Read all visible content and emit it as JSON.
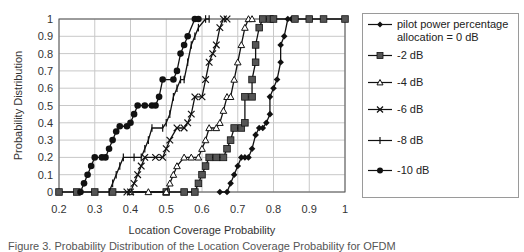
{
  "chart_data": {
    "type": "line",
    "title": "",
    "xlabel": "Location Coverage Probability",
    "ylabel": "Probability Distribution",
    "xlim": [
      0.2,
      1.0
    ],
    "ylim": [
      0,
      1
    ],
    "x_ticks": [
      "0.2",
      "0.3",
      "0.4",
      "0.5",
      "0.6",
      "0.7",
      "0.8",
      "0.9",
      "1"
    ],
    "y_ticks": [
      "0",
      "0.1",
      "0.2",
      "0.3",
      "0.4",
      "0.5",
      "0.6",
      "0.7",
      "0.8",
      "0.9",
      "1"
    ],
    "grid": true,
    "legend_position": "right",
    "series": [
      {
        "name": "pilot power percentage allocation = 0 dB",
        "marker": "diamond",
        "points": [
          [
            0.65,
            0
          ],
          [
            0.67,
            0.0
          ],
          [
            0.68,
            0.05
          ],
          [
            0.69,
            0.1
          ],
          [
            0.7,
            0.15
          ],
          [
            0.71,
            0.2
          ],
          [
            0.72,
            0.2
          ],
          [
            0.73,
            0.2
          ],
          [
            0.74,
            0.25
          ],
          [
            0.75,
            0.33
          ],
          [
            0.76,
            0.37
          ],
          [
            0.77,
            0.37
          ],
          [
            0.78,
            0.4
          ],
          [
            0.79,
            0.45
          ],
          [
            0.79,
            0.55
          ],
          [
            0.8,
            0.6
          ],
          [
            0.81,
            0.65
          ],
          [
            0.82,
            0.75
          ],
          [
            0.82,
            0.85
          ],
          [
            0.83,
            0.9
          ],
          [
            0.84,
            1.0
          ],
          [
            0.85,
            1.0
          ]
        ]
      },
      {
        "name": "-2 dB",
        "marker": "square",
        "points": [
          [
            0.2,
            0
          ],
          [
            0.25,
            0
          ],
          [
            0.3,
            0
          ],
          [
            0.35,
            0
          ],
          [
            0.5,
            0
          ],
          [
            0.55,
            0
          ],
          [
            0.58,
            0
          ],
          [
            0.59,
            0.05
          ],
          [
            0.6,
            0.1
          ],
          [
            0.61,
            0.15
          ],
          [
            0.62,
            0.2
          ],
          [
            0.64,
            0.2
          ],
          [
            0.66,
            0.2
          ],
          [
            0.67,
            0.25
          ],
          [
            0.68,
            0.3
          ],
          [
            0.69,
            0.37
          ],
          [
            0.71,
            0.37
          ],
          [
            0.72,
            0.4
          ],
          [
            0.72,
            0.55
          ],
          [
            0.74,
            0.55
          ],
          [
            0.74,
            0.65
          ],
          [
            0.75,
            0.75
          ],
          [
            0.75,
            0.85
          ],
          [
            0.76,
            0.95
          ],
          [
            0.77,
            1.0
          ],
          [
            0.79,
            1.0
          ],
          [
            0.8,
            1.0
          ],
          [
            0.86,
            1.0
          ],
          [
            0.9,
            1.0
          ],
          [
            0.94,
            1.0
          ],
          [
            1.0,
            1.0
          ]
        ]
      },
      {
        "name": "-4 dB",
        "marker": "triangle",
        "points": [
          [
            0.4,
            0
          ],
          [
            0.45,
            0
          ],
          [
            0.5,
            0
          ],
          [
            0.51,
            0.05
          ],
          [
            0.52,
            0.1
          ],
          [
            0.53,
            0.15
          ],
          [
            0.55,
            0.2
          ],
          [
            0.57,
            0.2
          ],
          [
            0.59,
            0.2
          ],
          [
            0.6,
            0.25
          ],
          [
            0.61,
            0.3
          ],
          [
            0.62,
            0.37
          ],
          [
            0.64,
            0.37
          ],
          [
            0.65,
            0.4
          ],
          [
            0.66,
            0.47
          ],
          [
            0.67,
            0.55
          ],
          [
            0.68,
            0.55
          ],
          [
            0.69,
            0.65
          ],
          [
            0.7,
            0.75
          ],
          [
            0.71,
            0.85
          ],
          [
            0.72,
            0.95
          ],
          [
            0.73,
            1.0
          ],
          [
            0.74,
            1.0
          ]
        ]
      },
      {
        "name": "-6 dB",
        "marker": "x",
        "points": [
          [
            0.39,
            0
          ],
          [
            0.4,
            0.0
          ],
          [
            0.41,
            0.05
          ],
          [
            0.42,
            0.1
          ],
          [
            0.43,
            0.15
          ],
          [
            0.44,
            0.2
          ],
          [
            0.47,
            0.2
          ],
          [
            0.49,
            0.2
          ],
          [
            0.5,
            0.25
          ],
          [
            0.51,
            0.3
          ],
          [
            0.53,
            0.37
          ],
          [
            0.55,
            0.37
          ],
          [
            0.56,
            0.4
          ],
          [
            0.57,
            0.45
          ],
          [
            0.58,
            0.55
          ],
          [
            0.6,
            0.55
          ],
          [
            0.61,
            0.65
          ],
          [
            0.62,
            0.75
          ],
          [
            0.63,
            0.8
          ],
          [
            0.64,
            0.85
          ],
          [
            0.65,
            0.95
          ],
          [
            0.66,
            1.0
          ],
          [
            0.67,
            1.0
          ]
        ]
      },
      {
        "name": "-8 dB",
        "marker": "plus",
        "points": [
          [
            0.34,
            0
          ],
          [
            0.35,
            0.05
          ],
          [
            0.36,
            0.1
          ],
          [
            0.37,
            0.15
          ],
          [
            0.38,
            0.2
          ],
          [
            0.41,
            0.2
          ],
          [
            0.43,
            0.2
          ],
          [
            0.44,
            0.25
          ],
          [
            0.45,
            0.3
          ],
          [
            0.46,
            0.37
          ],
          [
            0.49,
            0.37
          ],
          [
            0.5,
            0.4
          ],
          [
            0.51,
            0.45
          ],
          [
            0.52,
            0.55
          ],
          [
            0.53,
            0.6
          ],
          [
            0.54,
            0.65
          ],
          [
            0.55,
            0.65
          ],
          [
            0.56,
            0.75
          ],
          [
            0.57,
            0.85
          ],
          [
            0.58,
            0.9
          ],
          [
            0.59,
            0.95
          ],
          [
            0.61,
            1.0
          ],
          [
            0.62,
            1.0
          ]
        ]
      },
      {
        "name": "-10 dB",
        "marker": "circle",
        "points": [
          [
            0.26,
            0
          ],
          [
            0.27,
            0.05
          ],
          [
            0.28,
            0.1
          ],
          [
            0.29,
            0.15
          ],
          [
            0.3,
            0.2
          ],
          [
            0.32,
            0.2
          ],
          [
            0.33,
            0.2
          ],
          [
            0.34,
            0.25
          ],
          [
            0.35,
            0.3
          ],
          [
            0.36,
            0.35
          ],
          [
            0.37,
            0.38
          ],
          [
            0.39,
            0.38
          ],
          [
            0.4,
            0.4
          ],
          [
            0.41,
            0.45
          ],
          [
            0.42,
            0.5
          ],
          [
            0.44,
            0.5
          ],
          [
            0.46,
            0.5
          ],
          [
            0.47,
            0.5
          ],
          [
            0.48,
            0.55
          ],
          [
            0.49,
            0.65
          ],
          [
            0.52,
            0.65
          ],
          [
            0.53,
            0.7
          ],
          [
            0.54,
            0.8
          ],
          [
            0.55,
            0.85
          ],
          [
            0.56,
            0.9
          ],
          [
            0.58,
            1.0
          ],
          [
            0.59,
            1.0
          ]
        ]
      }
    ]
  },
  "legend": {
    "items": [
      {
        "label": "pilot power percentage\nallocation = 0 dB",
        "marker": "diamond"
      },
      {
        "label": "-2 dB",
        "marker": "square"
      },
      {
        "label": "-4 dB",
        "marker": "triangle"
      },
      {
        "label": "-6 dB",
        "marker": "x"
      },
      {
        "label": "-8 dB",
        "marker": "plus"
      },
      {
        "label": "-10 dB",
        "marker": "circle"
      }
    ]
  },
  "caption": "Figure 3. Probability Distribution of the Location Coverage Probability for OFDM",
  "colors": {
    "line": "#111111",
    "grid": "#c8c8c8",
    "axis": "#555555"
  }
}
